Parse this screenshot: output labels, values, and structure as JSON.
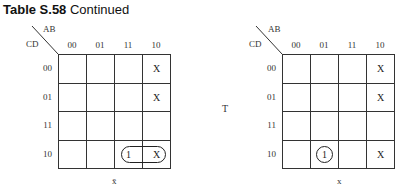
{
  "title": {
    "bold": "Table S.58",
    "rest": "Continued"
  },
  "maps": [
    {
      "col_var": "AB",
      "row_var": "CD",
      "col_labels": [
        "00",
        "01",
        "11",
        "10"
      ],
      "row_labels": [
        "00",
        "01",
        "11",
        "10"
      ],
      "cells": [
        [
          "",
          "",
          "",
          "X"
        ],
        [
          "",
          "",
          "",
          "X"
        ],
        [
          "",
          "",
          "",
          ""
        ],
        [
          "",
          "",
          "1",
          "X"
        ]
      ],
      "grouping": "loop around row 10, columns 11-10",
      "caption": "x̄"
    },
    {
      "col_var": "AB",
      "row_var": "CD",
      "col_labels": [
        "00",
        "01",
        "11",
        "10"
      ],
      "row_labels": [
        "00",
        "01",
        "11",
        "10"
      ],
      "cells": [
        [
          "",
          "",
          "",
          "X"
        ],
        [
          "",
          "",
          "",
          "X"
        ],
        [
          "",
          "",
          "",
          ""
        ],
        [
          "",
          "1",
          "",
          "X"
        ]
      ],
      "grouping": "circle around single 1 at row 10, column 01",
      "caption": "x"
    }
  ],
  "middle_label": "T"
}
